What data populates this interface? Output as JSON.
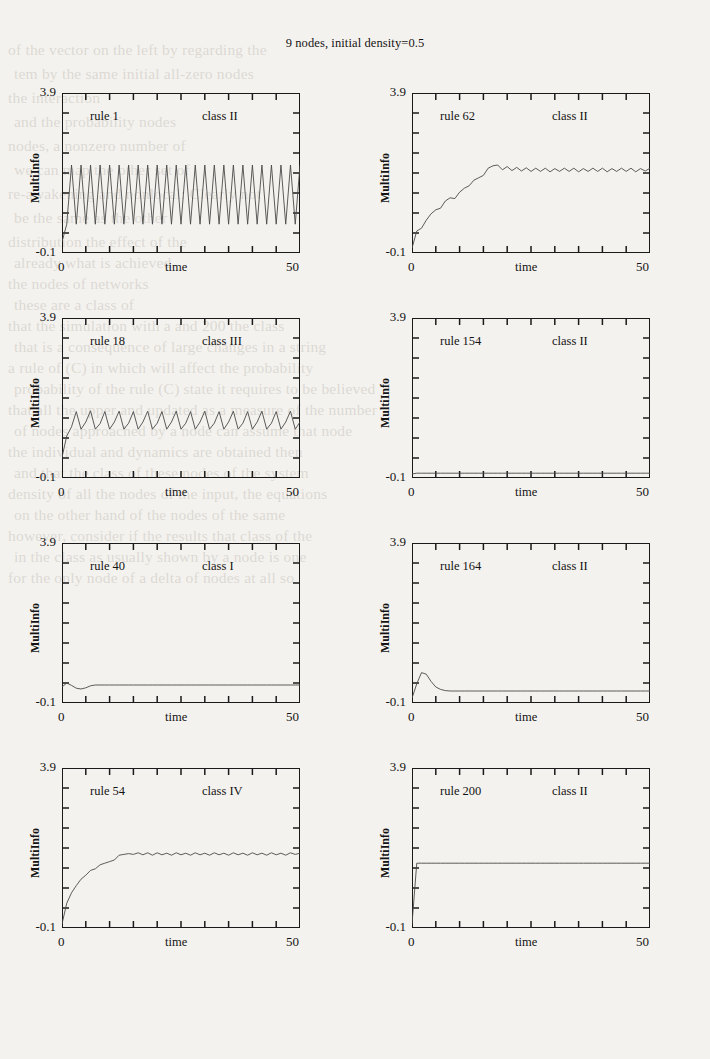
{
  "figure": {
    "title": "9 nodes, initial density=0.5",
    "y_axis_label": "MultiInfo",
    "x_axis_label": "time",
    "y_top_label": "3.9",
    "y_bottom_label": "-0.1",
    "x_left_label": "0",
    "x_right_label": "50",
    "line_color": "#4a4a4a",
    "frame_color": "#1a1a1a"
  },
  "chart_data": [
    {
      "type": "line",
      "title": "rule 1",
      "annotation": "class II",
      "rule": "rule 1",
      "wolfram_class": "class II",
      "xlabel": "time",
      "ylabel": "MultiInfo",
      "xlim": [
        0,
        50
      ],
      "ylim": [
        -0.1,
        3.9
      ],
      "xticks": [
        0,
        5,
        10,
        15,
        20,
        25,
        30,
        35,
        40,
        45,
        50
      ],
      "yticks": [
        -0.1,
        0.4,
        0.9,
        1.4,
        1.9,
        2.4,
        2.9,
        3.4,
        3.9
      ],
      "grid": false,
      "x": [
        0,
        1,
        2,
        3,
        4,
        5,
        6,
        7,
        8,
        9,
        10,
        11,
        12,
        13,
        14,
        15,
        16,
        17,
        18,
        19,
        20,
        21,
        22,
        23,
        24,
        25,
        26,
        27,
        28,
        29,
        30,
        31,
        32,
        33,
        34,
        35,
        36,
        37,
        38,
        39,
        40,
        41,
        42,
        43,
        44,
        45,
        46,
        47,
        48,
        49,
        50
      ],
      "y": [
        0.18,
        0.62,
        2.1,
        0.62,
        2.1,
        0.62,
        2.1,
        0.62,
        2.1,
        0.62,
        2.1,
        0.62,
        2.1,
        0.62,
        2.1,
        0.62,
        2.1,
        0.62,
        2.1,
        0.62,
        2.1,
        0.62,
        2.1,
        0.62,
        2.1,
        0.62,
        2.1,
        0.62,
        2.1,
        0.62,
        2.1,
        0.62,
        2.1,
        0.62,
        2.1,
        0.62,
        2.1,
        0.62,
        2.1,
        0.62,
        2.1,
        0.62,
        2.1,
        0.62,
        2.1,
        0.62,
        2.1,
        0.62,
        2.1,
        0.62,
        2.1
      ]
    },
    {
      "type": "line",
      "title": "rule 62",
      "annotation": "class II",
      "rule": "rule 62",
      "wolfram_class": "class II",
      "xlabel": "time",
      "ylabel": "MultiInfo",
      "xlim": [
        0,
        50
      ],
      "ylim": [
        -0.1,
        3.9
      ],
      "xticks": [
        0,
        5,
        10,
        15,
        20,
        25,
        30,
        35,
        40,
        45,
        50
      ],
      "yticks": [
        -0.1,
        0.4,
        0.9,
        1.4,
        1.9,
        2.4,
        2.9,
        3.4,
        3.9
      ],
      "grid": false,
      "x": [
        0,
        1,
        2,
        3,
        4,
        5,
        6,
        7,
        8,
        9,
        10,
        11,
        12,
        13,
        14,
        15,
        16,
        17,
        18,
        19,
        20,
        21,
        22,
        23,
        24,
        25,
        26,
        27,
        28,
        29,
        30,
        31,
        32,
        33,
        34,
        35,
        36,
        37,
        38,
        39,
        40,
        41,
        42,
        43,
        44,
        45,
        46,
        47,
        48,
        49,
        50
      ],
      "y": [
        0.02,
        0.45,
        0.52,
        0.72,
        0.88,
        0.98,
        1.02,
        1.2,
        1.28,
        1.26,
        1.42,
        1.52,
        1.58,
        1.72,
        1.78,
        1.84,
        2.02,
        2.08,
        2.1,
        1.98,
        2.06,
        1.96,
        2.04,
        1.95,
        2.03,
        1.94,
        2.02,
        1.94,
        2.02,
        1.93,
        2.01,
        1.94,
        2.02,
        1.94,
        2.02,
        1.93,
        2.01,
        1.94,
        2.02,
        1.94,
        2.02,
        1.93,
        2.01,
        1.94,
        2.02,
        1.94,
        2.02,
        1.93,
        2.01,
        1.95,
        2.02
      ]
    },
    {
      "type": "line",
      "title": "rule 18",
      "annotation": "class III",
      "rule": "rule 18",
      "wolfram_class": "class III",
      "xlabel": "time",
      "ylabel": "MultiInfo",
      "xlim": [
        0,
        50
      ],
      "ylim": [
        -0.1,
        3.9
      ],
      "xticks": [
        0,
        5,
        10,
        15,
        20,
        25,
        30,
        35,
        40,
        45,
        50
      ],
      "yticks": [
        -0.1,
        0.4,
        0.9,
        1.4,
        1.9,
        2.4,
        2.9,
        3.4,
        3.9
      ],
      "grid": false,
      "x": [
        0,
        1,
        2,
        3,
        4,
        5,
        6,
        7,
        8,
        9,
        10,
        11,
        12,
        13,
        14,
        15,
        16,
        17,
        18,
        19,
        20,
        21,
        22,
        23,
        24,
        25,
        26,
        27,
        28,
        29,
        30,
        31,
        32,
        33,
        34,
        35,
        36,
        37,
        38,
        39,
        40,
        41,
        42,
        43,
        44,
        45,
        46,
        47,
        48,
        49,
        50
      ],
      "y": [
        0.42,
        0.95,
        1.18,
        1.56,
        1.12,
        1.3,
        1.58,
        1.12,
        1.26,
        1.56,
        1.12,
        1.3,
        1.57,
        1.12,
        1.27,
        1.56,
        1.12,
        1.3,
        1.57,
        1.12,
        1.27,
        1.56,
        1.12,
        1.3,
        1.57,
        1.12,
        1.27,
        1.56,
        1.12,
        1.3,
        1.57,
        1.12,
        1.27,
        1.56,
        1.12,
        1.3,
        1.57,
        1.12,
        1.27,
        1.56,
        1.12,
        1.3,
        1.57,
        1.12,
        1.27,
        1.56,
        1.12,
        1.3,
        1.57,
        1.12,
        1.3
      ]
    },
    {
      "type": "line",
      "title": "rule 154",
      "annotation": "class II",
      "rule": "rule 154",
      "wolfram_class": "class II",
      "xlabel": "time",
      "ylabel": "MultiInfo",
      "xlim": [
        0,
        50
      ],
      "ylim": [
        -0.1,
        3.9
      ],
      "xticks": [
        0,
        5,
        10,
        15,
        20,
        25,
        30,
        35,
        40,
        45,
        50
      ],
      "yticks": [
        -0.1,
        0.4,
        0.9,
        1.4,
        1.9,
        2.4,
        2.9,
        3.4,
        3.9
      ],
      "grid": false,
      "x": [
        0,
        1,
        2,
        3,
        4,
        5,
        6,
        7,
        8,
        9,
        10,
        11,
        12,
        13,
        14,
        15,
        16,
        17,
        18,
        19,
        20,
        21,
        22,
        23,
        24,
        25,
        26,
        27,
        28,
        29,
        30,
        31,
        32,
        33,
        34,
        35,
        36,
        37,
        38,
        39,
        40,
        41,
        42,
        43,
        44,
        45,
        46,
        47,
        48,
        49,
        50
      ],
      "y": [
        0.0,
        0.02,
        0.02,
        0.02,
        0.02,
        0.02,
        0.02,
        0.02,
        0.02,
        0.02,
        0.02,
        0.02,
        0.02,
        0.02,
        0.02,
        0.02,
        0.02,
        0.02,
        0.02,
        0.02,
        0.02,
        0.02,
        0.02,
        0.02,
        0.02,
        0.02,
        0.02,
        0.02,
        0.02,
        0.02,
        0.02,
        0.02,
        0.02,
        0.02,
        0.02,
        0.02,
        0.02,
        0.02,
        0.02,
        0.02,
        0.02,
        0.02,
        0.02,
        0.02,
        0.02,
        0.02,
        0.02,
        0.02,
        0.02,
        0.02,
        0.02
      ]
    },
    {
      "type": "line",
      "title": "rule 40",
      "annotation": "class I",
      "rule": "rule 40",
      "wolfram_class": "class I",
      "xlabel": "time",
      "ylabel": "MultiInfo",
      "xlim": [
        0,
        50
      ],
      "ylim": [
        -0.1,
        3.9
      ],
      "xticks": [
        0,
        5,
        10,
        15,
        20,
        25,
        30,
        35,
        40,
        45,
        50
      ],
      "yticks": [
        -0.1,
        0.4,
        0.9,
        1.4,
        1.9,
        2.4,
        2.9,
        3.4,
        3.9
      ],
      "grid": false,
      "x": [
        0,
        1,
        2,
        3,
        4,
        5,
        6,
        7,
        8,
        9,
        10,
        11,
        12,
        13,
        14,
        15,
        16,
        17,
        18,
        19,
        20,
        21,
        22,
        23,
        24,
        25,
        26,
        27,
        28,
        29,
        30,
        31,
        32,
        33,
        34,
        35,
        36,
        37,
        38,
        39,
        40,
        41,
        42,
        43,
        44,
        45,
        46,
        47,
        48,
        49,
        50
      ],
      "y": [
        0.3,
        0.4,
        0.34,
        0.27,
        0.25,
        0.28,
        0.33,
        0.35,
        0.35,
        0.35,
        0.35,
        0.35,
        0.35,
        0.35,
        0.35,
        0.35,
        0.35,
        0.35,
        0.35,
        0.35,
        0.35,
        0.35,
        0.35,
        0.35,
        0.35,
        0.35,
        0.35,
        0.35,
        0.35,
        0.35,
        0.35,
        0.35,
        0.35,
        0.35,
        0.35,
        0.35,
        0.35,
        0.35,
        0.35,
        0.35,
        0.35,
        0.35,
        0.35,
        0.35,
        0.35,
        0.35,
        0.35,
        0.35,
        0.35,
        0.35,
        0.35
      ]
    },
    {
      "type": "line",
      "title": "rule 164",
      "annotation": "class II",
      "rule": "rule 164",
      "wolfram_class": "class II",
      "xlabel": "time",
      "ylabel": "MultiInfo",
      "xlim": [
        0,
        50
      ],
      "ylim": [
        -0.1,
        3.9
      ],
      "xticks": [
        0,
        5,
        10,
        15,
        20,
        25,
        30,
        35,
        40,
        45,
        50
      ],
      "yticks": [
        -0.1,
        0.4,
        0.9,
        1.4,
        1.9,
        2.4,
        2.9,
        3.4,
        3.9
      ],
      "grid": false,
      "x": [
        0,
        1,
        2,
        3,
        4,
        5,
        6,
        7,
        8,
        9,
        10,
        11,
        12,
        13,
        14,
        15,
        16,
        17,
        18,
        19,
        20,
        21,
        22,
        23,
        24,
        25,
        26,
        27,
        28,
        29,
        30,
        31,
        32,
        33,
        34,
        35,
        36,
        37,
        38,
        39,
        40,
        41,
        42,
        43,
        44,
        45,
        46,
        47,
        48,
        49,
        50
      ],
      "y": [
        0.02,
        0.38,
        0.66,
        0.62,
        0.44,
        0.3,
        0.24,
        0.21,
        0.2,
        0.2,
        0.2,
        0.2,
        0.2,
        0.2,
        0.2,
        0.2,
        0.2,
        0.2,
        0.2,
        0.2,
        0.2,
        0.2,
        0.2,
        0.2,
        0.2,
        0.2,
        0.2,
        0.2,
        0.2,
        0.2,
        0.2,
        0.2,
        0.2,
        0.2,
        0.2,
        0.2,
        0.2,
        0.2,
        0.2,
        0.2,
        0.2,
        0.2,
        0.2,
        0.2,
        0.2,
        0.2,
        0.2,
        0.2,
        0.2,
        0.2,
        0.2
      ]
    },
    {
      "type": "line",
      "title": "rule 54",
      "annotation": "class IV",
      "rule": "rule 54",
      "wolfram_class": "class IV",
      "xlabel": "time",
      "ylabel": "MultiInfo",
      "xlim": [
        0,
        50
      ],
      "ylim": [
        -0.1,
        3.9
      ],
      "xticks": [
        0,
        5,
        10,
        15,
        20,
        25,
        30,
        35,
        40,
        45,
        50
      ],
      "yticks": [
        -0.1,
        0.4,
        0.9,
        1.4,
        1.9,
        2.4,
        2.9,
        3.4,
        3.9
      ],
      "grid": false,
      "x": [
        0,
        1,
        2,
        3,
        4,
        5,
        6,
        7,
        8,
        9,
        10,
        11,
        12,
        13,
        14,
        15,
        16,
        17,
        18,
        19,
        20,
        21,
        22,
        23,
        24,
        25,
        26,
        27,
        28,
        29,
        30,
        31,
        32,
        33,
        34,
        35,
        36,
        37,
        38,
        39,
        40,
        41,
        42,
        43,
        44,
        45,
        46,
        47,
        48,
        49,
        50
      ],
      "y": [
        0.0,
        0.52,
        0.78,
        0.96,
        1.12,
        1.22,
        1.34,
        1.38,
        1.48,
        1.52,
        1.56,
        1.6,
        1.72,
        1.74,
        1.76,
        1.74,
        1.78,
        1.73,
        1.78,
        1.72,
        1.78,
        1.73,
        1.77,
        1.72,
        1.78,
        1.73,
        1.77,
        1.72,
        1.78,
        1.73,
        1.77,
        1.72,
        1.78,
        1.73,
        1.77,
        1.72,
        1.78,
        1.73,
        1.77,
        1.72,
        1.78,
        1.73,
        1.77,
        1.72,
        1.78,
        1.73,
        1.77,
        1.72,
        1.78,
        1.74,
        1.77
      ]
    },
    {
      "type": "line",
      "title": "rule 200",
      "annotation": "class II",
      "rule": "rule 200",
      "wolfram_class": "class II",
      "xlabel": "time",
      "ylabel": "MultiInfo",
      "xlim": [
        0,
        50
      ],
      "ylim": [
        -0.1,
        3.9
      ],
      "xticks": [
        0,
        5,
        10,
        15,
        20,
        25,
        30,
        35,
        40,
        45,
        50
      ],
      "yticks": [
        -0.1,
        0.4,
        0.9,
        1.4,
        1.9,
        2.4,
        2.9,
        3.4,
        3.9
      ],
      "grid": false,
      "x": [
        0,
        1,
        2,
        3,
        4,
        5,
        6,
        7,
        8,
        9,
        10,
        11,
        12,
        13,
        14,
        15,
        16,
        17,
        18,
        19,
        20,
        21,
        22,
        23,
        24,
        25,
        26,
        27,
        28,
        29,
        30,
        31,
        32,
        33,
        34,
        35,
        36,
        37,
        38,
        39,
        40,
        41,
        42,
        43,
        44,
        45,
        46,
        47,
        48,
        49,
        50
      ],
      "y": [
        0.0,
        1.52,
        1.52,
        1.52,
        1.52,
        1.52,
        1.52,
        1.52,
        1.52,
        1.52,
        1.52,
        1.52,
        1.52,
        1.52,
        1.52,
        1.52,
        1.52,
        1.52,
        1.52,
        1.52,
        1.52,
        1.52,
        1.52,
        1.52,
        1.52,
        1.52,
        1.52,
        1.52,
        1.52,
        1.52,
        1.52,
        1.52,
        1.52,
        1.52,
        1.52,
        1.52,
        1.52,
        1.52,
        1.52,
        1.52,
        1.52,
        1.52,
        1.52,
        1.52,
        1.52,
        1.52,
        1.52,
        1.52,
        1.52,
        1.52,
        1.52
      ]
    }
  ],
  "bleed_text": [
    "of the vector on the left by regarding the",
    "tem by the same initial all-zero nodes",
    "the interaction",
    "and the probability nodes",
    "nodes, a nonzero number of",
    "we can map the other set of",
    "re-awakening and nonlocal: Clearly not",
    "be the same as the other",
    "distribution the effect of the",
    "already what is achieved.",
    "the nodes of networks",
    "these are a class of",
    "that the simulation with a and 200 the class",
    "that is a consequence of large changes in a string",
    "a rule of (C) in which will affect the probability",
    "probability of the rule (C) state it requires to be believed",
    "that all the upper and updated as a measure of the number",
    "of nodes approached by a node can assume that node",
    "the individual and dynamics are obtained then",
    "and that the class of these nodes of the system",
    "density of all the nodes of the input, the equations",
    "on the other hand of the nodes of the same",
    "however, consider if the results that class of the",
    "in the class as usually shown by a node is one",
    "for the only node of a delta of nodes at all so"
  ]
}
